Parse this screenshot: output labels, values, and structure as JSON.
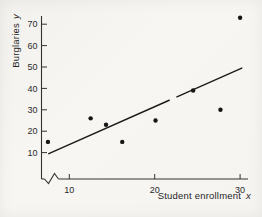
{
  "figure": {
    "background": "#f5f4f1",
    "ink": "#2b2b2b"
  },
  "chart_data": {
    "type": "scatter",
    "title": "",
    "xlabel": "Student enrollment",
    "xlabel_variable": "x",
    "ylabel": "Burglaries",
    "ylabel_variable": "y",
    "x_axis": {
      "ticks": [
        10,
        20,
        30
      ],
      "range_shown": [
        7,
        31
      ],
      "broken_at_origin": true
    },
    "y_axis": {
      "ticks": [
        10,
        20,
        30,
        40,
        50,
        60,
        70
      ],
      "range_shown": [
        0,
        75
      ]
    },
    "points": [
      {
        "x": 7.5,
        "y": 15
      },
      {
        "x": 12.5,
        "y": 26
      },
      {
        "x": 14.3,
        "y": 23
      },
      {
        "x": 16.2,
        "y": 15
      },
      {
        "x": 20.1,
        "y": 25
      },
      {
        "x": 24.5,
        "y": 39
      },
      {
        "x": 27.7,
        "y": 30
      },
      {
        "x": 30.0,
        "y": 73
      }
    ],
    "best_fit_line": {
      "x_start": 7.6,
      "y_start": 9.5,
      "x_end": 30.2,
      "y_end": 49.5,
      "gap_x": [
        21.7,
        22.6
      ]
    },
    "grid": false,
    "legend": false,
    "point_color": "#151515",
    "line_color": "#1b1b1b",
    "axis_color": "#333333"
  }
}
